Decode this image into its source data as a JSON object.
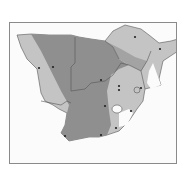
{
  "map": {
    "region": "Southern Africa",
    "colors": {
      "background": "#fbfbfb",
      "dark_zone": "#8f8f8f",
      "light_zone": "#c4c4c4",
      "border": "#555555",
      "point": "#222222"
    },
    "zones": [
      "dark",
      "light",
      "unshaded"
    ],
    "points_count": 14
  }
}
